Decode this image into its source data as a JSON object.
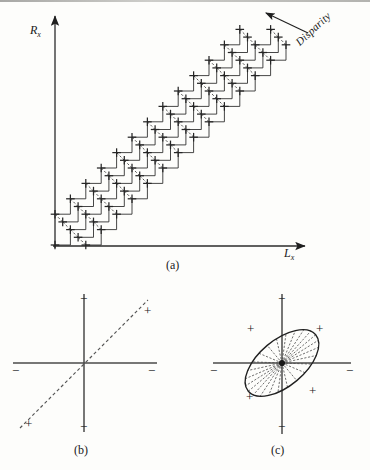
{
  "figure": {
    "caption_a": "(a)",
    "caption_b": "(b)",
    "caption_c": "(c)",
    "panel_a": {
      "y_axis_label": "R",
      "y_axis_sub": "x",
      "x_axis_label": "L",
      "x_axis_sub": "x",
      "annotation": "Disparity",
      "stroke_color": "#262626",
      "dash_color": "#3a3a3a",
      "band": {
        "origin": [
          55,
          245
        ],
        "end": [
          272,
          28
        ],
        "node_spacing": 15.4,
        "band_half_width_nodes": 2,
        "node_marker": "cross"
      }
    },
    "panel_b": {
      "center": [
        84,
        363
      ],
      "axis_color": "#4a4a4a",
      "diagonal_style": "dashed",
      "signs": [
        {
          "text": "−",
          "x": 84,
          "y": 300,
          "pos": "top"
        },
        {
          "text": "−",
          "x": 16,
          "y": 372,
          "pos": "left"
        },
        {
          "text": "−",
          "x": 152,
          "y": 372,
          "pos": "right"
        },
        {
          "text": "−",
          "x": 84,
          "y": 428,
          "pos": "bottom"
        },
        {
          "text": "+",
          "x": 148,
          "y": 312,
          "pos": "diagonal-upper-right"
        },
        {
          "text": "+",
          "x": 29,
          "y": 425,
          "pos": "diagonal-lower-left"
        }
      ]
    },
    "panel_c": {
      "center": [
        282,
        363
      ],
      "axis_color": "#4a4a4a",
      "ellipse": {
        "rx": 44,
        "ry": 23,
        "rotation_deg": -40,
        "spokes": 24
      },
      "signs": [
        {
          "text": "−",
          "x": 282,
          "y": 300,
          "pos": "top"
        },
        {
          "text": "−",
          "x": 214,
          "y": 372,
          "pos": "left"
        },
        {
          "text": "−",
          "x": 350,
          "y": 372,
          "pos": "right"
        },
        {
          "text": "−",
          "x": 282,
          "y": 428,
          "pos": "bottom"
        },
        {
          "text": "+",
          "x": 251,
          "y": 330,
          "pos": "upper-left"
        },
        {
          "text": "+",
          "x": 320,
          "y": 330,
          "pos": "upper-right"
        },
        {
          "text": "+",
          "x": 250,
          "y": 398,
          "pos": "lower-left"
        },
        {
          "text": "+",
          "x": 313,
          "y": 392,
          "pos": "lower-right"
        }
      ]
    }
  }
}
